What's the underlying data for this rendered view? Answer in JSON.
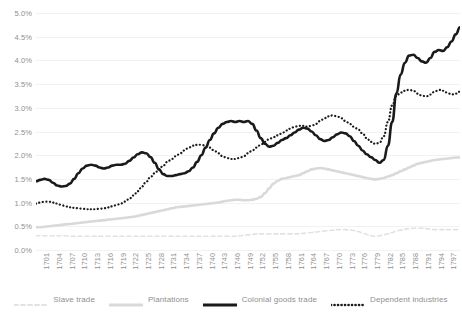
{
  "chart_data": {
    "type": "line",
    "title": "",
    "xlabel": "",
    "ylabel": "",
    "ylim": [
      0.0,
      5.0
    ],
    "ytick_labels": [
      "0.0%",
      "0.5%",
      "1.0%",
      "1.5%",
      "2.0%",
      "2.5%",
      "3.0%",
      "3.5%",
      "4.0%",
      "4.5%",
      "5.0%"
    ],
    "ytick_values": [
      0.0,
      0.5,
      1.0,
      1.5,
      2.0,
      2.5,
      3.0,
      3.5,
      4.0,
      4.5,
      5.0
    ],
    "grid": true,
    "grid_axis": "y",
    "legend_position": "bottom",
    "x_start": 1700,
    "x_end": 1800,
    "xtick_labels": [
      "1701",
      "1704",
      "1707",
      "1710",
      "1713",
      "1716",
      "1719",
      "1722",
      "1725",
      "1728",
      "1731",
      "1734",
      "1737",
      "1740",
      "1743",
      "1746",
      "1749",
      "1752",
      "1755",
      "1758",
      "1761",
      "1764",
      "1767",
      "1770",
      "1773",
      "1776",
      "1779",
      "1782",
      "1785",
      "1788",
      "1791",
      "1794",
      "1797",
      "1800"
    ],
    "x": [
      1700,
      1701,
      1702,
      1703,
      1704,
      1705,
      1706,
      1707,
      1708,
      1709,
      1710,
      1711,
      1712,
      1713,
      1714,
      1715,
      1716,
      1717,
      1718,
      1719,
      1720,
      1721,
      1722,
      1723,
      1724,
      1725,
      1726,
      1727,
      1728,
      1729,
      1730,
      1731,
      1732,
      1733,
      1734,
      1735,
      1736,
      1737,
      1738,
      1739,
      1740,
      1741,
      1742,
      1743,
      1744,
      1745,
      1746,
      1747,
      1748,
      1749,
      1750,
      1751,
      1752,
      1753,
      1754,
      1755,
      1756,
      1757,
      1758,
      1759,
      1760,
      1761,
      1762,
      1763,
      1764,
      1765,
      1766,
      1767,
      1768,
      1769,
      1770,
      1771,
      1772,
      1773,
      1774,
      1775,
      1776,
      1777,
      1778,
      1779,
      1780,
      1781,
      1782,
      1783,
      1784,
      1785,
      1786,
      1787,
      1788,
      1789,
      1790,
      1791,
      1792,
      1793,
      1794,
      1795,
      1796,
      1797,
      1798,
      1799,
      1800
    ],
    "series": [
      {
        "name": "Slave trade",
        "color": "#e2e2e2",
        "style": "dashed",
        "width": 1.6,
        "values": [
          0.3,
          0.3,
          0.3,
          0.3,
          0.3,
          0.3,
          0.3,
          0.3,
          0.29,
          0.29,
          0.29,
          0.29,
          0.29,
          0.29,
          0.29,
          0.29,
          0.29,
          0.29,
          0.29,
          0.29,
          0.29,
          0.29,
          0.29,
          0.29,
          0.29,
          0.29,
          0.29,
          0.29,
          0.29,
          0.29,
          0.29,
          0.29,
          0.29,
          0.29,
          0.29,
          0.29,
          0.29,
          0.29,
          0.29,
          0.29,
          0.29,
          0.29,
          0.29,
          0.29,
          0.29,
          0.29,
          0.29,
          0.29,
          0.3,
          0.31,
          0.32,
          0.33,
          0.34,
          0.34,
          0.34,
          0.34,
          0.34,
          0.34,
          0.34,
          0.34,
          0.34,
          0.34,
          0.34,
          0.35,
          0.36,
          0.37,
          0.38,
          0.39,
          0.4,
          0.41,
          0.42,
          0.43,
          0.43,
          0.43,
          0.42,
          0.41,
          0.39,
          0.36,
          0.33,
          0.3,
          0.29,
          0.3,
          0.32,
          0.34,
          0.37,
          0.4,
          0.42,
          0.44,
          0.45,
          0.46,
          0.46,
          0.46,
          0.45,
          0.44,
          0.43,
          0.43,
          0.43,
          0.43,
          0.43,
          0.43,
          0.43
        ]
      },
      {
        "name": "Plantations",
        "color": "#d9d9d9",
        "style": "solid",
        "width": 2.6,
        "values": [
          0.48,
          0.48,
          0.49,
          0.5,
          0.51,
          0.52,
          0.53,
          0.54,
          0.55,
          0.56,
          0.57,
          0.58,
          0.59,
          0.6,
          0.61,
          0.62,
          0.63,
          0.64,
          0.65,
          0.66,
          0.67,
          0.68,
          0.69,
          0.7,
          0.72,
          0.74,
          0.76,
          0.78,
          0.8,
          0.82,
          0.84,
          0.86,
          0.88,
          0.9,
          0.91,
          0.92,
          0.93,
          0.94,
          0.95,
          0.96,
          0.97,
          0.98,
          0.99,
          1.0,
          1.02,
          1.04,
          1.05,
          1.06,
          1.06,
          1.05,
          1.05,
          1.06,
          1.08,
          1.12,
          1.2,
          1.3,
          1.4,
          1.46,
          1.5,
          1.52,
          1.54,
          1.56,
          1.58,
          1.62,
          1.66,
          1.7,
          1.72,
          1.73,
          1.72,
          1.7,
          1.68,
          1.66,
          1.64,
          1.62,
          1.6,
          1.58,
          1.56,
          1.54,
          1.52,
          1.5,
          1.49,
          1.5,
          1.52,
          1.55,
          1.58,
          1.62,
          1.66,
          1.7,
          1.74,
          1.78,
          1.82,
          1.84,
          1.86,
          1.88,
          1.9,
          1.91,
          1.92,
          1.93,
          1.94,
          1.95,
          1.95
        ]
      },
      {
        "name": "Colonial goods trade",
        "color": "#1a1a1a",
        "style": "solid",
        "width": 2.6,
        "values": [
          1.45,
          1.48,
          1.5,
          1.48,
          1.42,
          1.36,
          1.34,
          1.35,
          1.4,
          1.5,
          1.62,
          1.72,
          1.78,
          1.8,
          1.78,
          1.74,
          1.72,
          1.74,
          1.78,
          1.8,
          1.8,
          1.82,
          1.88,
          1.95,
          2.02,
          2.06,
          2.04,
          1.96,
          1.84,
          1.7,
          1.6,
          1.56,
          1.56,
          1.58,
          1.6,
          1.62,
          1.66,
          1.74,
          1.86,
          2.0,
          2.16,
          2.32,
          2.46,
          2.58,
          2.66,
          2.7,
          2.72,
          2.7,
          2.72,
          2.7,
          2.72,
          2.66,
          2.52,
          2.36,
          2.24,
          2.18,
          2.2,
          2.26,
          2.32,
          2.36,
          2.42,
          2.48,
          2.54,
          2.58,
          2.56,
          2.5,
          2.42,
          2.34,
          2.3,
          2.32,
          2.38,
          2.44,
          2.48,
          2.46,
          2.4,
          2.3,
          2.2,
          2.1,
          2.02,
          1.96,
          1.9,
          1.84,
          1.9,
          2.2,
          2.7,
          3.3,
          3.7,
          3.95,
          4.1,
          4.12,
          4.05,
          3.98,
          3.95,
          4.05,
          4.18,
          4.22,
          4.2,
          4.28,
          4.4,
          4.55,
          4.7
        ]
      },
      {
        "name": "Dependent industries",
        "color": "#1a1a1a",
        "style": "dotted",
        "width": 2.2,
        "values": [
          0.98,
          1.0,
          1.02,
          1.02,
          1.0,
          0.98,
          0.95,
          0.92,
          0.9,
          0.89,
          0.88,
          0.87,
          0.86,
          0.86,
          0.86,
          0.87,
          0.88,
          0.9,
          0.92,
          0.95,
          0.98,
          1.02,
          1.08,
          1.15,
          1.24,
          1.34,
          1.44,
          1.54,
          1.62,
          1.7,
          1.78,
          1.86,
          1.92,
          1.98,
          2.04,
          2.1,
          2.16,
          2.2,
          2.22,
          2.22,
          2.2,
          2.16,
          2.1,
          2.04,
          1.98,
          1.94,
          1.92,
          1.92,
          1.94,
          1.98,
          2.04,
          2.1,
          2.16,
          2.22,
          2.28,
          2.34,
          2.38,
          2.42,
          2.46,
          2.52,
          2.56,
          2.6,
          2.62,
          2.62,
          2.6,
          2.62,
          2.66,
          2.72,
          2.78,
          2.82,
          2.84,
          2.82,
          2.78,
          2.72,
          2.66,
          2.6,
          2.54,
          2.46,
          2.36,
          2.28,
          2.24,
          2.26,
          2.4,
          2.7,
          3.05,
          3.25,
          3.32,
          3.36,
          3.38,
          3.36,
          3.3,
          3.26,
          3.24,
          3.28,
          3.34,
          3.38,
          3.36,
          3.32,
          3.28,
          3.3,
          3.34
        ]
      }
    ]
  }
}
